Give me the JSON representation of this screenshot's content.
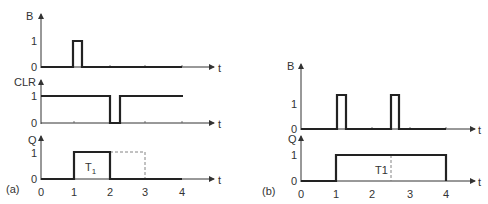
{
  "panel_a": {
    "caption": "(a)",
    "axis_time_label": "t",
    "x_ticks": [
      "0",
      "1",
      "2",
      "3",
      "4"
    ],
    "signals": [
      {
        "name": "B",
        "levels": [
          "1",
          "0"
        ],
        "desc": "single pulse at t=1"
      },
      {
        "name": "CLR",
        "levels": [
          "1",
          "0"
        ],
        "desc": "high, drops to 0 at t=2, returns high shortly after"
      },
      {
        "name": "Q",
        "levels": [
          "1",
          "0"
        ],
        "desc": "high from t=1 to t=2 (cleared), dashed continuation to t=3"
      }
    ],
    "pulse_label": "T",
    "pulse_label_sub": "1"
  },
  "panel_b": {
    "caption": "(b)",
    "axis_time_label": "t",
    "x_ticks": [
      "0",
      "1",
      "2",
      "3",
      "4"
    ],
    "signals": [
      {
        "name": "B",
        "levels": [
          "1",
          "0"
        ],
        "desc": "pulses at t=1 and t=2.5"
      },
      {
        "name": "Q",
        "levels": [
          "1",
          "0"
        ],
        "desc": "high from t=1 to t=4 (retriggered)"
      }
    ],
    "pulse_label": "T1"
  }
}
